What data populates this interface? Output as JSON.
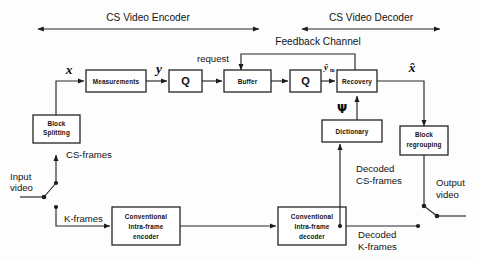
{
  "diagram": {
    "spans": [
      {
        "id": "encoder",
        "label": "CS Video Encoder"
      },
      {
        "id": "decoder",
        "label": "CS Video Decoder"
      }
    ],
    "channel": {
      "label": "Feedback Channel",
      "request_label": "request"
    },
    "blocks": [
      {
        "id": "measurements",
        "label": "Measurements"
      },
      {
        "id": "quantizer-encode",
        "label": "Q"
      },
      {
        "id": "buffer",
        "label": "Buffer"
      },
      {
        "id": "quantizer-decode",
        "label": "Q"
      },
      {
        "id": "recovery",
        "label": "Recovery"
      },
      {
        "id": "block-splitting",
        "label_line1": "Block",
        "label_line2": "Splitting"
      },
      {
        "id": "dictionary",
        "label": "Dictionary"
      },
      {
        "id": "block-regrouping",
        "label_line1": "Block",
        "label_line2": "regrouping"
      },
      {
        "id": "intra-frame-encoder",
        "label_line1": "Conventional",
        "label_line2": "Intra-frame",
        "label_line3": "encoder"
      },
      {
        "id": "intra-frame-decoder",
        "label_line1": "Conventional",
        "label_line2": "Intra-frame",
        "label_line3": "decoder"
      }
    ],
    "signals": {
      "x": "x",
      "y": "y",
      "y_hat": "ŷ",
      "y_hat_sub": "m",
      "x_hat": "x̂",
      "psi": "Ψ"
    },
    "flow_labels": {
      "input_video_line1": "Input",
      "input_video_line2": "video",
      "output_video_line1": "Output",
      "output_video_line2": "video",
      "cs_frames": "CS-frames",
      "k_frames": "K-frames",
      "decoded_cs_line1": "Decoded",
      "decoded_cs_line2": "CS-frames",
      "decoded_k_line1": "Decoded",
      "decoded_k_line2": "K-frames"
    },
    "colors": {
      "stroke": "#1c1c1c",
      "text": "#111111",
      "background": "#ffffff"
    }
  }
}
